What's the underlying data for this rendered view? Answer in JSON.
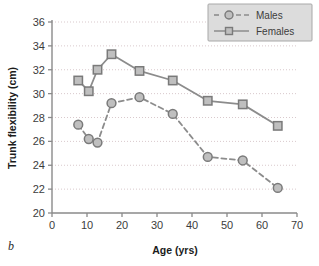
{
  "panel": {
    "label": "b"
  },
  "chart_data": {
    "type": "line",
    "title": "",
    "xlabel": "Age (yrs)",
    "ylabel": "Trunk flexibility (cm)",
    "xlim": [
      0,
      70
    ],
    "ylim": [
      20,
      36
    ],
    "xticks": [
      0,
      10,
      20,
      30,
      40,
      50,
      60,
      70
    ],
    "yticks": [
      20,
      22,
      24,
      26,
      28,
      30,
      32,
      34,
      36
    ],
    "xtick_labels": [
      "0",
      "10",
      "20",
      "30",
      "40",
      "50",
      "60",
      "70"
    ],
    "ytick_labels": [
      "20",
      "22",
      "24",
      "26",
      "28",
      "30",
      "32",
      "34",
      "36"
    ],
    "grid": "horizontal-dotted",
    "legend_position": "top-right",
    "series": [
      {
        "name": "Males",
        "marker": "circle",
        "linestyle": "dashed",
        "color": "#8c8c8c",
        "marker_fill": "#bfbfbf",
        "x": [
          7.5,
          10.5,
          13,
          17,
          25,
          34.5,
          44.5,
          54.5,
          64.5
        ],
        "values": [
          27.4,
          26.2,
          25.9,
          29.2,
          29.7,
          28.3,
          24.7,
          24.4,
          22.1
        ]
      },
      {
        "name": "Females",
        "marker": "square",
        "linestyle": "solid",
        "color": "#8c8c8c",
        "marker_fill": "#bfbfbf",
        "x": [
          7.5,
          10.5,
          13,
          17,
          25,
          34.5,
          44.5,
          54.5,
          64.5
        ],
        "values": [
          31.1,
          30.2,
          32.0,
          33.3,
          31.9,
          31.1,
          29.4,
          29.1,
          27.3
        ]
      }
    ]
  },
  "legend": {
    "items": [
      {
        "label": "Males"
      },
      {
        "label": "Females"
      }
    ]
  },
  "colors": {
    "line": "#8c8c8c",
    "marker_fill": "#bfbfbf",
    "marker_edge": "#7a7a7a",
    "grid": "#d9c9cc",
    "axis": "#8a8a8a",
    "text": "#2a2a2a",
    "legend_bg": "#dcdcdc",
    "legend_border": "#a8a8a8"
  }
}
